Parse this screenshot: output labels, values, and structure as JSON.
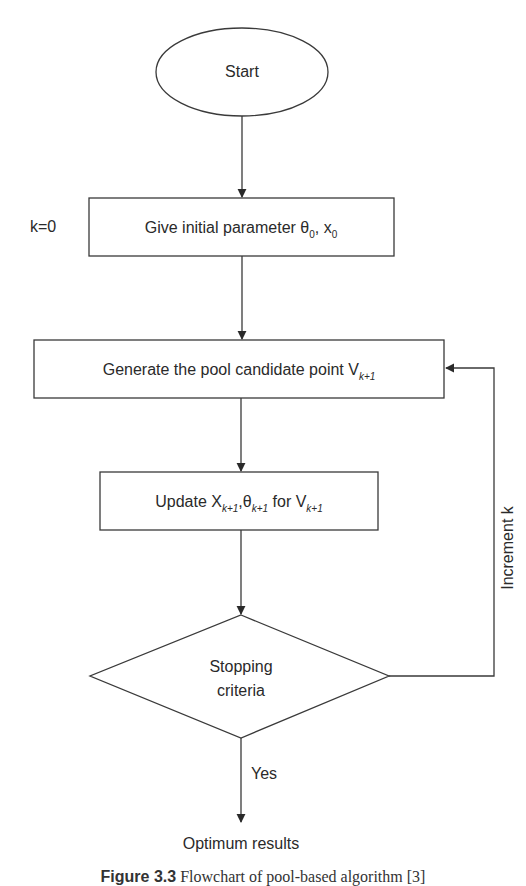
{
  "diagram": {
    "type": "flowchart",
    "nodes": {
      "start": {
        "shape": "ellipse",
        "label": "Start"
      },
      "init": {
        "shape": "rectangle",
        "label": "Give initial parameter θ",
        "sub1": "0",
        "mid": ", x",
        "sub2": "0",
        "side_label": "k=0"
      },
      "generate": {
        "shape": "rectangle",
        "label": "Generate the pool candidate point V",
        "sub1": "k+1"
      },
      "update": {
        "shape": "rectangle",
        "p1": "Update X",
        "s1": "k+1",
        "p2": ",θ",
        "s2": "k+1",
        "p3": " for V",
        "s3": "k+1"
      },
      "decision": {
        "shape": "diamond",
        "line1": "Stopping",
        "line2": "criteria"
      },
      "end": {
        "shape": "text",
        "label": "Optimum results"
      }
    },
    "edges": {
      "loop_label": "Increment k",
      "yes_label": "Yes"
    },
    "caption": {
      "prefix": "Figure 3.3",
      "text": " Flowchart of pool-based algorithm [3]"
    },
    "colors": {
      "stroke": "#3a3a3a",
      "text": "#2a2a2a",
      "background": "#ffffff"
    }
  }
}
